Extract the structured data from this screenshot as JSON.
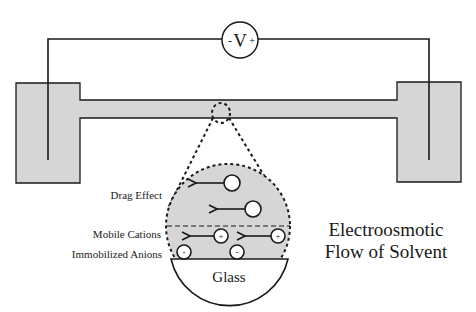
{
  "diagram": {
    "title_line1": "Electroosmotic",
    "title_line2": "Flow of Solvent",
    "voltmeter": {
      "minus": "-",
      "symbol": "V",
      "plus": "+"
    },
    "labels": {
      "drag_effect": "Drag Effect",
      "mobile_cations": "Mobile Cations",
      "immobilized_anions": "Immobilized Anions",
      "glass": "Glass"
    },
    "ions": {
      "cation_sign": "+",
      "anion_sign": "-"
    },
    "colors": {
      "stroke": "#1a1a1a",
      "fill_gray": "#d6d6d6",
      "background": "#ffffff"
    }
  }
}
